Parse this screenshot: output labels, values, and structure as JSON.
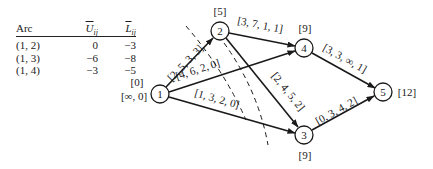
{
  "table": {
    "headers": {
      "arc": "Arc",
      "u": "U",
      "u_sub": "ij",
      "l": "L",
      "l_sub": "ij"
    },
    "rows": [
      {
        "arc": "(1, 2)",
        "u": "0",
        "l": "−3"
      },
      {
        "arc": "(1, 3)",
        "u": "−6",
        "l": "−8"
      },
      {
        "arc": "(1, 4)",
        "u": "−3",
        "l": "−5"
      }
    ]
  },
  "nodes": [
    {
      "id": "1",
      "label": "1",
      "annotation": "[0]",
      "annotation2": "[∞, 0]"
    },
    {
      "id": "2",
      "label": "2",
      "annotation": "[5]"
    },
    {
      "id": "3",
      "label": "3",
      "annotation": "[9]"
    },
    {
      "id": "4",
      "label": "4",
      "annotation": "[9]"
    },
    {
      "id": "5",
      "label": "5",
      "annotation": "[12]"
    }
  ],
  "arcs": [
    {
      "from": "1",
      "to": "2",
      "label": "[2, 5, 3, 3]"
    },
    {
      "from": "1",
      "to": "4",
      "label": "[4, 6, 2, 0]"
    },
    {
      "from": "1",
      "to": "3",
      "label": "[1, 3, 2, 0]"
    },
    {
      "from": "2",
      "to": "4",
      "label": "[3, 7, 1, 1]"
    },
    {
      "from": "2",
      "to": "3",
      "label": "[2, 4, 5, 2]"
    },
    {
      "from": "4",
      "to": "5",
      "label": "[3, 3, ∞, 1]"
    },
    {
      "from": "3",
      "to": "5",
      "label": "[0, 3, 4, 2]"
    }
  ]
}
